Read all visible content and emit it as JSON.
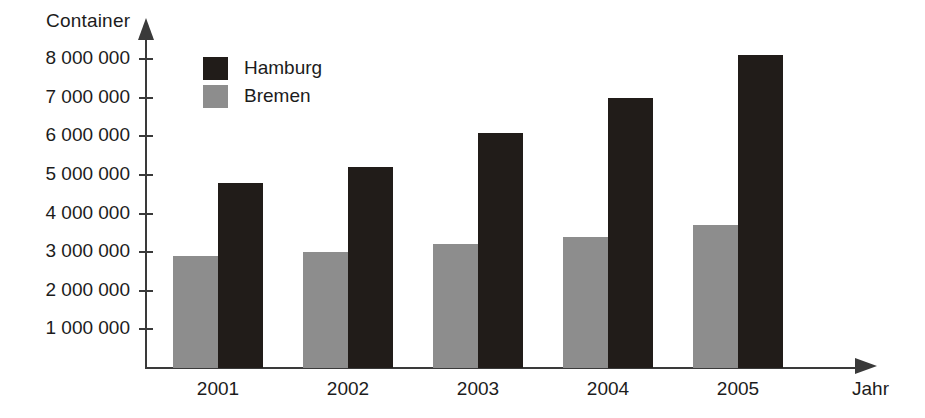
{
  "chart_data": {
    "type": "bar",
    "title": "",
    "xlabel": "Jahr",
    "ylabel": "Container",
    "categories": [
      "2001",
      "2002",
      "2003",
      "2004",
      "2005"
    ],
    "series": [
      {
        "name": "Hamburg",
        "color": "#211c19",
        "values": [
          4800000,
          5200000,
          6100000,
          7000000,
          8100000
        ]
      },
      {
        "name": "Bremen",
        "color": "#8d8d8d",
        "values": [
          2900000,
          3000000,
          3200000,
          3400000,
          3700000
        ]
      }
    ],
    "ylim": [
      0,
      8600000
    ],
    "ytick_values": [
      1000000,
      2000000,
      3000000,
      4000000,
      5000000,
      6000000,
      7000000,
      8000000
    ],
    "ytick_labels": [
      "1 000 000",
      "2 000 000",
      "3 000 000",
      "4 000 000",
      "5 000 000",
      "6 000 000",
      "7 000 000",
      "8 000 000"
    ],
    "grid": false,
    "legend_position": "top-left-inside"
  },
  "axes": {
    "y_title": "Container",
    "x_title": "Jahr"
  },
  "legend": {
    "items": [
      {
        "label": "Hamburg",
        "color": "#211c19"
      },
      {
        "label": "Bremen",
        "color": "#8d8d8d"
      }
    ]
  }
}
